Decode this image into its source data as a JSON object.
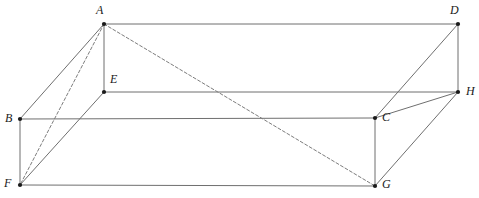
{
  "figure": {
    "type": "geometry-diagram",
    "width": 479,
    "height": 198,
    "background_color": "#ffffff",
    "line_color": "#6f6f6f",
    "dash_color": "#7d7d7d",
    "vertex_color": "#1a1a1a",
    "label_color": "#1a1a1a",
    "stroke_width": 1,
    "dash_pattern": "3 2.2",
    "vertex_radius": 2.1,
    "vertices": [
      {
        "id": "A",
        "label": "A",
        "x": 104,
        "y": 24,
        "label_x": 96,
        "label_y": 4
      },
      {
        "id": "B",
        "label": "B",
        "x": 20,
        "y": 119,
        "label_x": 5,
        "label_y": 112
      },
      {
        "id": "C",
        "label": "C",
        "x": 375,
        "y": 118,
        "label_x": 382,
        "label_y": 111
      },
      {
        "id": "D",
        "label": "D",
        "x": 458,
        "y": 24,
        "label_x": 450,
        "label_y": 4
      },
      {
        "id": "E",
        "label": "E",
        "x": 104,
        "y": 92,
        "label_x": 110,
        "label_y": 73
      },
      {
        "id": "F",
        "label": "F",
        "x": 20,
        "y": 185,
        "label_x": 4,
        "label_y": 177
      },
      {
        "id": "G",
        "label": "G",
        "x": 375,
        "y": 186,
        "label_x": 382,
        "label_y": 178
      },
      {
        "id": "H",
        "label": "H",
        "x": 458,
        "y": 92,
        "label_x": 466,
        "label_y": 85
      }
    ],
    "edges": [
      {
        "from": "A",
        "to": "D",
        "style": "solid",
        "name": "edge-AD"
      },
      {
        "from": "A",
        "to": "E",
        "style": "solid",
        "name": "edge-AE"
      },
      {
        "from": "A",
        "to": "B",
        "style": "solid",
        "name": "edge-AB"
      },
      {
        "from": "D",
        "to": "H",
        "style": "solid",
        "name": "edge-DH"
      },
      {
        "from": "D",
        "to": "C",
        "style": "solid",
        "name": "edge-DC"
      },
      {
        "from": "E",
        "to": "H",
        "style": "solid",
        "name": "edge-EH"
      },
      {
        "from": "E",
        "to": "F",
        "style": "solid",
        "name": "edge-EF"
      },
      {
        "from": "B",
        "to": "C",
        "style": "solid",
        "name": "edge-BC"
      },
      {
        "from": "B",
        "to": "F",
        "style": "solid",
        "name": "edge-BF"
      },
      {
        "from": "C",
        "to": "G",
        "style": "solid",
        "name": "edge-CG"
      },
      {
        "from": "C",
        "to": "H",
        "style": "solid",
        "name": "edge-CH"
      },
      {
        "from": "F",
        "to": "G",
        "style": "solid",
        "name": "edge-FG"
      },
      {
        "from": "G",
        "to": "H",
        "style": "solid",
        "name": "edge-GH"
      }
    ],
    "diagonals": [
      {
        "from": "A",
        "to": "G",
        "style": "dashed",
        "name": "diagonal-AG"
      },
      {
        "from": "A",
        "to": "F",
        "style": "dashed",
        "name": "diagonal-AF"
      }
    ]
  }
}
